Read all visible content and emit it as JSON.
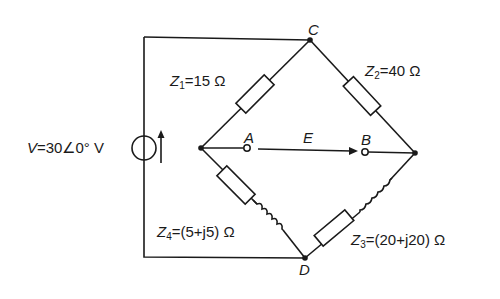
{
  "diagram": {
    "type": "ac-bridge-circuit",
    "source": {
      "symbol": "V",
      "label_prefix": "V",
      "value": "=30∠0° V",
      "magnitude": 30,
      "angle_deg": 0,
      "unit": "V"
    },
    "nodes": {
      "top": "C",
      "bottom": "D",
      "probe_left": "A",
      "probe_right": "B"
    },
    "voltage_arrow": {
      "label": "E",
      "from": "A",
      "to": "B"
    },
    "impedances": [
      {
        "id": "Z1",
        "base": "Z",
        "sub": "1",
        "value": "=15 Ω",
        "branch": "left-node to C",
        "elements": [
          "resistor"
        ]
      },
      {
        "id": "Z2",
        "base": "Z",
        "sub": "2",
        "value": "=40 Ω",
        "branch": "C to right-node",
        "elements": [
          "resistor"
        ]
      },
      {
        "id": "Z3",
        "base": "Z",
        "sub": "3",
        "value": "=(20+j20) Ω",
        "branch": "right-node to D",
        "elements": [
          "inductor",
          "resistor"
        ]
      },
      {
        "id": "Z4",
        "base": "Z",
        "sub": "4",
        "value": "=(5+j5) Ω",
        "branch": "left-node to D",
        "elements": [
          "resistor",
          "inductor"
        ]
      }
    ],
    "colors": {
      "line": "#1a1a1a",
      "background": "#ffffff"
    }
  }
}
